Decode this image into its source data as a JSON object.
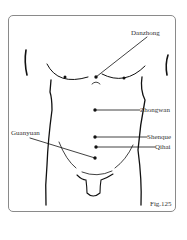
{
  "figure": {
    "caption": "Fig.125",
    "points": [
      {
        "name": "Danzhong"
      },
      {
        "name": "Zhongwan"
      },
      {
        "name": "Shenque"
      },
      {
        "name": "Qihai"
      },
      {
        "name": "Guanyuan"
      }
    ]
  }
}
